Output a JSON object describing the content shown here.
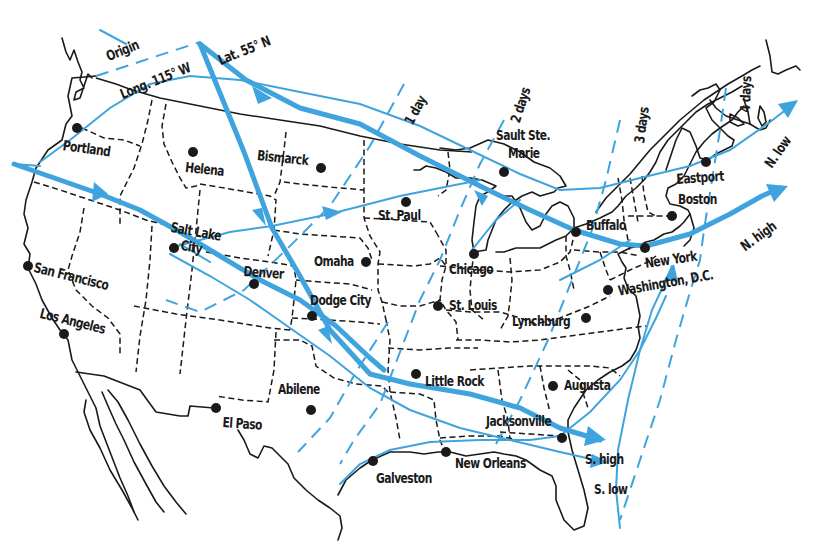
{
  "colors": {
    "track": "#3fa4dd",
    "outline": "#1a1a1a",
    "background": "#ffffff"
  },
  "annotations": {
    "origin": "Origin",
    "longitude": "Long. 115° W",
    "latitude": "Lat. 55° N"
  },
  "isochrones": [
    {
      "label": "1 day"
    },
    {
      "label": "2 days"
    },
    {
      "label": "3 days"
    },
    {
      "label": "4 days"
    }
  ],
  "tracks": [
    {
      "label": "N. low"
    },
    {
      "label": "N. high"
    },
    {
      "label": "S. high"
    },
    {
      "label": "S. low"
    }
  ],
  "cities": [
    {
      "name": "Portland"
    },
    {
      "name": "Helena"
    },
    {
      "name": "Bismarck"
    },
    {
      "name": "St. Paul"
    },
    {
      "name": "Salt Lake"
    },
    {
      "name": "City"
    },
    {
      "name": "San Francisco"
    },
    {
      "name": "Denver"
    },
    {
      "name": "Omaha"
    },
    {
      "name": "Dodge City"
    },
    {
      "name": "Los Angeles"
    },
    {
      "name": "Abilene"
    },
    {
      "name": "El Paso"
    },
    {
      "name": "Chicago"
    },
    {
      "name": "St. Louis"
    },
    {
      "name": "Little Rock"
    },
    {
      "name": "Galveston"
    },
    {
      "name": "New Orleans"
    },
    {
      "name": "Jacksonville"
    },
    {
      "name": "Augusta"
    },
    {
      "name": "Lynchburg"
    },
    {
      "name": "Washington, D.C."
    },
    {
      "name": "New York"
    },
    {
      "name": "Buffalo"
    },
    {
      "name": "Boston"
    },
    {
      "name": "Eastport"
    },
    {
      "name": "Sault Ste."
    },
    {
      "name": "Marie"
    }
  ]
}
